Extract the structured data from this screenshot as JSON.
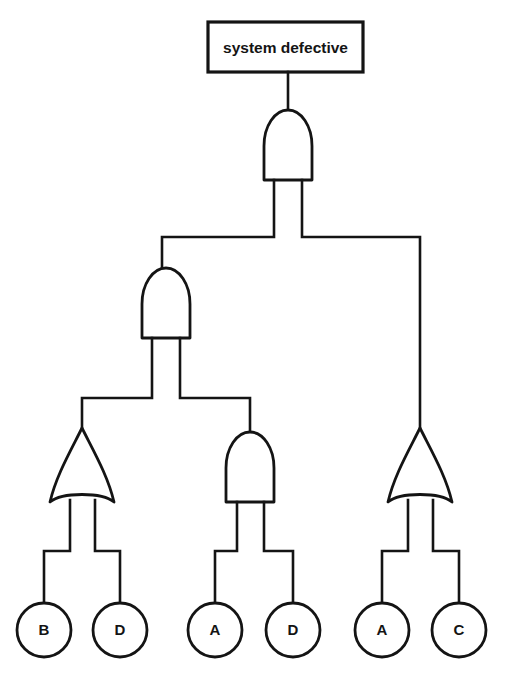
{
  "diagram": {
    "type": "fault-tree",
    "title_event": {
      "id": "top-event",
      "label": "system defective",
      "shape": "rectangle",
      "x": 208,
      "y": 22,
      "width": 155,
      "height": 50
    },
    "gates": [
      {
        "id": "gate-top",
        "type": "AND",
        "symbol": "and-gate",
        "cx": 288,
        "top": 110,
        "bottom": 180,
        "half_width": 24,
        "feeds": "top-event",
        "inputs": [
          "gate-mid-left",
          "gate-or-right"
        ]
      },
      {
        "id": "gate-mid-left",
        "type": "AND",
        "symbol": "and-gate",
        "cx": 166,
        "top": 268,
        "bottom": 338,
        "half_width": 24,
        "feeds": "gate-top",
        "inputs": [
          "gate-or-left",
          "gate-and-mid"
        ]
      },
      {
        "id": "gate-or-left",
        "type": "OR",
        "symbol": "or-gate",
        "cx": 82,
        "top": 428,
        "bottom": 502,
        "half_width": 32,
        "feeds": "gate-mid-left",
        "inputs": [
          "leaf-b",
          "leaf-d1"
        ]
      },
      {
        "id": "gate-and-mid",
        "type": "AND",
        "symbol": "and-gate",
        "cx": 250,
        "top": 432,
        "bottom": 502,
        "half_width": 24,
        "feeds": "gate-mid-left",
        "inputs": [
          "leaf-a1",
          "leaf-d2"
        ]
      },
      {
        "id": "gate-or-right",
        "type": "OR",
        "symbol": "or-gate",
        "cx": 420,
        "top": 428,
        "bottom": 502,
        "half_width": 32,
        "feeds": "gate-top",
        "inputs": [
          "leaf-a2",
          "leaf-c"
        ]
      }
    ],
    "basic_events": [
      {
        "id": "leaf-b",
        "label": "B",
        "cx": 44,
        "cy": 630,
        "r": 27
      },
      {
        "id": "leaf-d1",
        "label": "D",
        "cx": 120,
        "cy": 630,
        "r": 27
      },
      {
        "id": "leaf-a1",
        "label": "A",
        "cx": 215,
        "cy": 630,
        "r": 27
      },
      {
        "id": "leaf-d2",
        "label": "D",
        "cx": 293,
        "cy": 630,
        "r": 27
      },
      {
        "id": "leaf-a2",
        "label": "A",
        "cx": 382,
        "cy": 630,
        "r": 27
      },
      {
        "id": "leaf-c",
        "label": "C",
        "cx": 459,
        "cy": 630,
        "r": 27
      }
    ],
    "colors": {
      "stroke": "#141414",
      "background": "#ffffff",
      "fill": "#ffffff"
    }
  }
}
